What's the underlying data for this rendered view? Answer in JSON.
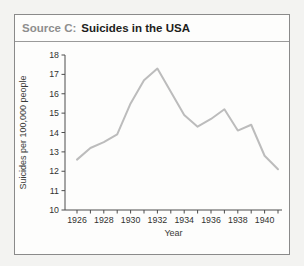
{
  "panel": {
    "source_label": "Source C:",
    "title": "Suicides in the USA"
  },
  "chart_data": {
    "type": "line",
    "title": "Suicides in the USA",
    "xlabel": "Year",
    "ylabel": "Suicides per 100,000 people",
    "x": [
      1926,
      1927,
      1928,
      1929,
      1930,
      1931,
      1932,
      1933,
      1934,
      1935,
      1936,
      1937,
      1938,
      1939,
      1940,
      1941
    ],
    "values": [
      12.6,
      13.2,
      13.5,
      13.9,
      15.5,
      16.7,
      17.3,
      16.1,
      14.9,
      14.3,
      14.7,
      15.2,
      14.1,
      14.4,
      12.8,
      12.1
    ],
    "ylim": [
      10,
      18
    ],
    "ytick_interval": 1,
    "xtick_interval": 1,
    "xtick_label_interval": 2,
    "grid": false,
    "legend": "none",
    "colors": {
      "line": "#bcbcbc",
      "axis": "#4d4d4d",
      "tick_label": "#323230",
      "axis_title": "#3a3a38",
      "source_label": "#8e8e8e",
      "title_text": "#1d1d1b",
      "panel_border": "#8a8a8a",
      "panel_bg": "#fdfdfc",
      "page_bg": "#f3f3f1"
    }
  }
}
